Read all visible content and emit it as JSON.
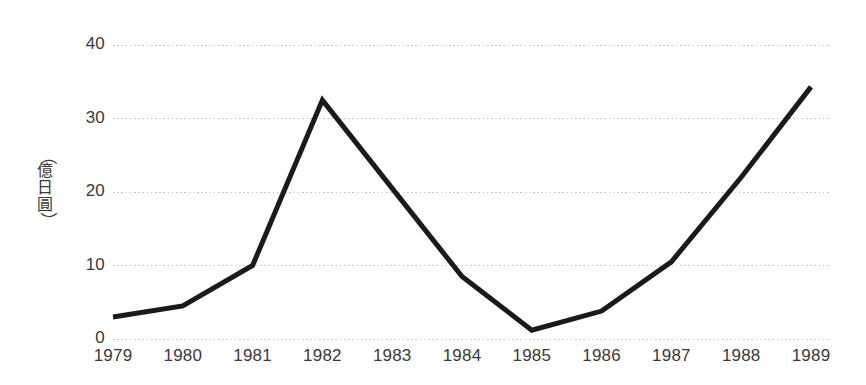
{
  "chart_data": {
    "type": "line",
    "title": "",
    "subtitle": "",
    "xlabel": "",
    "ylabel": "（億日圓）",
    "ylabel_chars": [
      "（",
      "億",
      "日",
      "圓",
      "）"
    ],
    "categories": [
      "1979",
      "1980",
      "1981",
      "1982",
      "1983",
      "1984",
      "1985",
      "1986",
      "1987",
      "1988",
      "1989"
    ],
    "values": [
      3,
      4.5,
      10,
      32.5,
      20.5,
      8.5,
      1.2,
      3.8,
      10.5,
      22,
      34.3
    ],
    "series": [
      {
        "name": "",
        "values": [
          3,
          4.5,
          10,
          32.5,
          20.5,
          8.5,
          1.2,
          3.8,
          10.5,
          22,
          34.3
        ]
      }
    ],
    "x": [
      "1979",
      "1980",
      "1981",
      "1982",
      "1983",
      "1984",
      "1985",
      "1986",
      "1987",
      "1988",
      "1989"
    ],
    "ylim": [
      0,
      40
    ],
    "yticks": [
      "0",
      "10",
      "20",
      "30",
      "40"
    ],
    "ytick_values": [
      0,
      10,
      20,
      30,
      40
    ],
    "grid": true,
    "grid_style": "dotted-horizontal",
    "legend": false,
    "legend_position": "none",
    "line_color": "#1a1a1a",
    "line_width": 5,
    "grid_color": "#c8c8c8",
    "text_color": "#3a3a3a",
    "background_color": "#ffffff",
    "markers": false,
    "annotations": []
  }
}
